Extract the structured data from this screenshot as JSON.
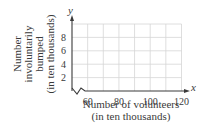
{
  "chart_data": {
    "type": "line",
    "title": "",
    "xlabel": "Number of volunteers (in ten thousands)",
    "xlabel_lines": [
      "Number of volunteers",
      "(in ten thousands)"
    ],
    "ylabel": "Number involuntarily bumped (in ten thousands)",
    "ylabel_lines": [
      "Number",
      "involuntarily",
      "bumped",
      "(in ten thousands)"
    ],
    "x_axis_symbol": "x",
    "y_axis_symbol": "y",
    "xlim": [
      50,
      120
    ],
    "ylim": [
      0,
      10
    ],
    "x_ticks": [
      60,
      80,
      100,
      120
    ],
    "x_tick_labels": [
      "60",
      "80",
      "100",
      "120"
    ],
    "y_ticks": [
      2,
      4,
      6,
      8
    ],
    "y_tick_labels": [
      "2",
      "4",
      "6",
      "8"
    ],
    "x_grid_step": 10,
    "y_grid_step": 2,
    "grid": true,
    "x_axis_break": true,
    "series": [],
    "legend": null
  }
}
